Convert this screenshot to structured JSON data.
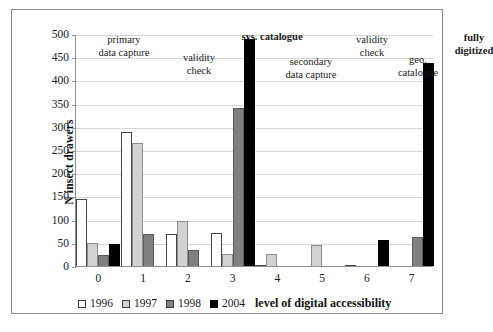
{
  "chart_data": {
    "type": "bar",
    "title": "",
    "xlabel": "level of digital accessibility",
    "ylabel": "N insect drawers",
    "categories": [
      "0",
      "1",
      "2",
      "3",
      "4",
      "5",
      "6",
      "7"
    ],
    "ylim": [
      0,
      500
    ],
    "yticks": [
      0,
      50,
      100,
      150,
      200,
      250,
      300,
      350,
      400,
      450,
      500
    ],
    "grid": true,
    "legend_position": "bottom-left",
    "series": [
      {
        "name": "1996",
        "color": "#ffffff",
        "values": [
          145,
          288,
          68,
          71,
          3,
          0,
          3,
          0
        ]
      },
      {
        "name": "1997",
        "color": "#d2d2d2",
        "values": [
          49,
          265,
          97,
          26,
          25,
          45,
          0,
          0
        ]
      },
      {
        "name": "1998",
        "color": "#808080",
        "values": [
          24,
          68,
          35,
          340,
          0,
          0,
          0,
          63
        ]
      },
      {
        "name": "2004",
        "color": "#000000",
        "values": [
          48,
          0,
          0,
          490,
          0,
          0,
          56,
          437
        ]
      }
    ],
    "annotations": [
      {
        "text_lines": [
          "primary",
          "data capture"
        ],
        "bold": false
      },
      {
        "text_lines": [
          "validity",
          "check"
        ],
        "bold": false
      },
      {
        "text_lines": [
          "sys. catalogue"
        ],
        "bold": true
      },
      {
        "text_lines": [
          "secondary",
          "data capture"
        ],
        "bold": false
      },
      {
        "text_lines": [
          "validity",
          "check"
        ],
        "bold": false
      },
      {
        "text_lines": [
          "geo.",
          "catalogue"
        ],
        "bold": false
      },
      {
        "text_lines": [
          "fully",
          "digitized"
        ],
        "bold": true
      }
    ]
  },
  "annotation_text": {
    "a0_line1": "primary",
    "a0_line2": "data capture",
    "a1_line1": "validity",
    "a1_line2": "check",
    "a2_line1": "sys. catalogue",
    "a3_line1": "secondary",
    "a3_line2": "data capture",
    "a4_line1": "validity",
    "a4_line2": "check",
    "a5_line1": "geo.",
    "a5_line2": "catalogue",
    "a6_line1": "fully",
    "a6_line2": "digitized"
  },
  "axis": {
    "y_title": "N insect drawers",
    "x_title": "level of digital accessibility",
    "y_tick_labels": [
      "500",
      "450",
      "400",
      "350",
      "300",
      "250",
      "200",
      "150",
      "100",
      "50",
      "0"
    ],
    "x_tick_labels": [
      "0",
      "1",
      "2",
      "3",
      "4",
      "5",
      "6",
      "7"
    ]
  },
  "legend": {
    "items": [
      {
        "label": "1996"
      },
      {
        "label": "1997"
      },
      {
        "label": "1998"
      },
      {
        "label": "2004"
      }
    ]
  }
}
